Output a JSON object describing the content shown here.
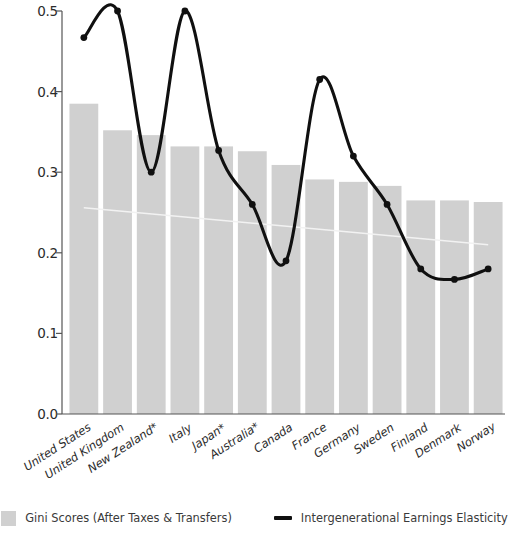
{
  "chart_data": {
    "type": "bar",
    "title": "",
    "subtitle": "",
    "xlabel": "",
    "ylabel": "",
    "ylim": [
      0.0,
      0.5
    ],
    "yticks": [
      "0.0",
      "0.1",
      "0.2",
      "0.3",
      "0.4",
      "0.5"
    ],
    "ytick_values": [
      0.0,
      0.1,
      0.2,
      0.3,
      0.4,
      0.5
    ],
    "grid": false,
    "legend_position": "bottom",
    "categories": [
      "United States",
      "United Kingdom",
      "New Zealand*",
      "Italy",
      "Japan*",
      "Australia*",
      "Canada",
      "France",
      "Germany",
      "Sweden",
      "Finland",
      "Denmark",
      "Norway"
    ],
    "series": [
      {
        "name": "Gini Scores (After Taxes & Transfers)",
        "type": "bar",
        "color": "#d0d0d0",
        "values": [
          0.385,
          0.352,
          0.346,
          0.332,
          0.332,
          0.326,
          0.309,
          0.291,
          0.288,
          0.283,
          0.265,
          0.265,
          0.263
        ]
      },
      {
        "name": "Intergenerational Earnings Elasticity",
        "type": "line",
        "color": "#101010",
        "values": [
          0.467,
          0.5,
          0.3,
          0.5,
          0.327,
          0.26,
          0.19,
          0.415,
          0.32,
          0.26,
          0.18,
          0.167,
          0.18
        ]
      }
    ],
    "trendline": {
      "name": "gini-trendline",
      "color": "#f2f2f2",
      "start_value": 0.256,
      "end_value": 0.21
    }
  },
  "legend": {
    "items": [
      {
        "label": "Gini Scores (After Taxes & Transfers)",
        "marker": "square-swatch-icon"
      },
      {
        "label": "Intergenerational Earnings Elasticity",
        "marker": "line-swatch-icon"
      }
    ]
  }
}
